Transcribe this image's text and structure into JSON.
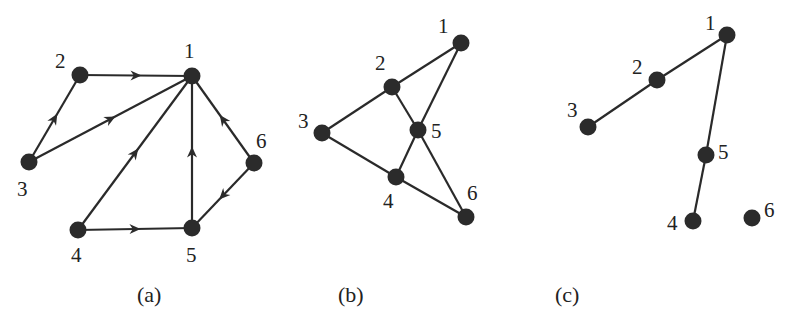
{
  "colors": {
    "ink": "#2b2b2b",
    "background": "#ffffff"
  },
  "panels": [
    {
      "id": "a",
      "caption": "(a)",
      "directed": true,
      "nodes": [
        {
          "id": "1",
          "label": "1",
          "x": 192,
          "y": 76,
          "lx": 184,
          "ly": 58
        },
        {
          "id": "2",
          "label": "2",
          "x": 80,
          "y": 75,
          "lx": 55,
          "ly": 68
        },
        {
          "id": "3",
          "label": "3",
          "x": 29,
          "y": 162,
          "lx": 17,
          "ly": 196
        },
        {
          "id": "4",
          "label": "4",
          "x": 78,
          "y": 230,
          "lx": 71,
          "ly": 262
        },
        {
          "id": "5",
          "label": "5",
          "x": 192,
          "y": 228,
          "lx": 186,
          "ly": 262
        },
        {
          "id": "6",
          "label": "6",
          "x": 254,
          "y": 163,
          "lx": 256,
          "ly": 148
        }
      ],
      "edges": [
        {
          "from": "2",
          "to": "1"
        },
        {
          "from": "3",
          "to": "2"
        },
        {
          "from": "3",
          "to": "1"
        },
        {
          "from": "4",
          "to": "1"
        },
        {
          "from": "4",
          "to": "5"
        },
        {
          "from": "5",
          "to": "1"
        },
        {
          "from": "6",
          "to": "1"
        },
        {
          "from": "6",
          "to": "5"
        }
      ]
    },
    {
      "id": "b",
      "caption": "(b)",
      "directed": false,
      "nodes": [
        {
          "id": "1",
          "label": "1",
          "x": 461,
          "y": 43,
          "lx": 438,
          "ly": 33
        },
        {
          "id": "2",
          "label": "2",
          "x": 392,
          "y": 87,
          "lx": 375,
          "ly": 70
        },
        {
          "id": "3",
          "label": "3",
          "x": 322,
          "y": 133,
          "lx": 298,
          "ly": 128
        },
        {
          "id": "4",
          "label": "4",
          "x": 396,
          "y": 177,
          "lx": 383,
          "ly": 208
        },
        {
          "id": "5",
          "label": "5",
          "x": 418,
          "y": 130,
          "lx": 431,
          "ly": 138
        },
        {
          "id": "6",
          "label": "6",
          "x": 466,
          "y": 217,
          "lx": 467,
          "ly": 200
        }
      ],
      "edges": [
        {
          "from": "1",
          "to": "2"
        },
        {
          "from": "1",
          "to": "5"
        },
        {
          "from": "2",
          "to": "3"
        },
        {
          "from": "2",
          "to": "5"
        },
        {
          "from": "3",
          "to": "4"
        },
        {
          "from": "4",
          "to": "5"
        },
        {
          "from": "4",
          "to": "6"
        },
        {
          "from": "5",
          "to": "6"
        }
      ]
    },
    {
      "id": "c",
      "caption": "(c)",
      "directed": false,
      "nodes": [
        {
          "id": "1",
          "label": "1",
          "x": 727,
          "y": 35,
          "lx": 705,
          "ly": 30
        },
        {
          "id": "2",
          "label": "2",
          "x": 657,
          "y": 80,
          "lx": 632,
          "ly": 74
        },
        {
          "id": "3",
          "label": "3",
          "x": 588,
          "y": 127,
          "lx": 567,
          "ly": 117
        },
        {
          "id": "4",
          "label": "4",
          "x": 693,
          "y": 221,
          "lx": 667,
          "ly": 230
        },
        {
          "id": "5",
          "label": "5",
          "x": 706,
          "y": 155,
          "lx": 718,
          "ly": 159
        },
        {
          "id": "6",
          "label": "6",
          "x": 752,
          "y": 218,
          "lx": 764,
          "ly": 217
        }
      ],
      "edges": [
        {
          "from": "1",
          "to": "2"
        },
        {
          "from": "2",
          "to": "3"
        },
        {
          "from": "1",
          "to": "5"
        },
        {
          "from": "5",
          "to": "4"
        }
      ]
    }
  ],
  "captions_pos": [
    {
      "panel": "a",
      "x": 137,
      "y": 302
    },
    {
      "panel": "b",
      "x": 338,
      "y": 302
    },
    {
      "panel": "c",
      "x": 555,
      "y": 302
    }
  ]
}
